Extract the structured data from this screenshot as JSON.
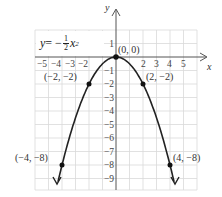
{
  "chart_data": {
    "type": "line",
    "title": "",
    "equation": {
      "lhs": "y",
      "eq": " = −",
      "num": "1",
      "den": "2",
      "var": "x",
      "exp": "2"
    },
    "xlabel": "x",
    "ylabel": "y",
    "xlim": [
      -6,
      6
    ],
    "ylim": [
      -10,
      2
    ],
    "grid": true,
    "x_ticks": [
      "−5",
      "−4",
      "−3",
      "−2",
      "2",
      "3",
      "4",
      "5"
    ],
    "y_ticks": [
      "1",
      "−1",
      "−2",
      "−3",
      "−4",
      "−5",
      "−6",
      "−7",
      "−8",
      "−9"
    ],
    "series": [
      {
        "name": "y = -1/2 x^2",
        "x": [
          -4.3,
          -4,
          -2,
          0,
          2,
          4,
          4.3
        ],
        "y": [
          -9.25,
          -8,
          -2,
          0,
          -2,
          -8,
          -9.25
        ]
      }
    ],
    "points": [
      {
        "label": "(0, 0)",
        "x": 0,
        "y": 0
      },
      {
        "label": "(−2, −2)",
        "x": -2,
        "y": -2
      },
      {
        "label": "(2, −2)",
        "x": 2,
        "y": -2
      },
      {
        "label": "(−4, −8)",
        "x": -4,
        "y": -8
      },
      {
        "label": "(4, −8)",
        "x": 4,
        "y": -8
      }
    ],
    "colors": {
      "grid": "#d8d8d8",
      "axis": "#555555",
      "curve": "#222222"
    }
  }
}
